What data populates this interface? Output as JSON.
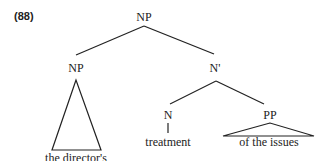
{
  "example_number": "(88)",
  "tree": {
    "root": "NP",
    "left_child": {
      "label": "NP",
      "terminal": "the director's",
      "triangle": true
    },
    "right_child": {
      "label": "N'",
      "children": [
        {
          "label": "N",
          "terminal": "treatment",
          "triangle": false
        },
        {
          "label": "PP",
          "terminal": "of the issues",
          "triangle": true
        }
      ]
    }
  }
}
